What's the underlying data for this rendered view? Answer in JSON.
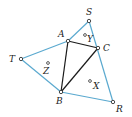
{
  "diagram": {
    "colors": {
      "outer": "#5aa9cf",
      "inner": "#1a1a1a",
      "vertex_fill": "#ffffff",
      "label": "#222222"
    },
    "vertices": {
      "S": {
        "label": "S",
        "x": 89,
        "y": 21
      },
      "A": {
        "label": "A",
        "x": 68,
        "y": 41
      },
      "C": {
        "label": "C",
        "x": 98,
        "y": 48
      },
      "T": {
        "label": "T",
        "x": 21,
        "y": 59
      },
      "B": {
        "label": "B",
        "x": 61,
        "y": 92
      },
      "R": {
        "label": "R",
        "x": 113,
        "y": 102
      }
    },
    "interior_points": {
      "Y": {
        "label": "Y",
        "x": 85,
        "y": 35
      },
      "Z": {
        "label": "Z",
        "x": 48,
        "y": 63
      },
      "X": {
        "label": "X",
        "x": 90,
        "y": 81
      }
    },
    "outer_edges": [
      [
        "T",
        "A"
      ],
      [
        "A",
        "S"
      ],
      [
        "S",
        "C"
      ],
      [
        "C",
        "R"
      ],
      [
        "R",
        "B"
      ],
      [
        "B",
        "T"
      ]
    ],
    "inner_triangle": [
      "A",
      "B",
      "C"
    ]
  }
}
